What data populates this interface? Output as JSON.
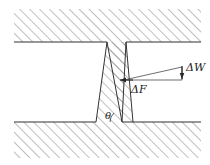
{
  "figure": {
    "type": "mechanics-crack-wedge-diagram",
    "background_color": "#ffffff",
    "line_color": "#333333",
    "hatch_color": "#808080",
    "labels": {
      "force_increment": "ΔF",
      "work_increment": "ΔW",
      "crack_angle": "θ"
    },
    "arrows": [
      {
        "name": "force-increment-arrow",
        "label": "ΔF",
        "direction": "left",
        "description": "horizontal arrow pointing into the crack wall"
      },
      {
        "name": "work-increment-arrow",
        "label": "ΔW",
        "direction": "down",
        "description": "short vertical arrow at the right tip of the wedge"
      }
    ],
    "regions": [
      {
        "name": "upper-block",
        "hatched": true
      },
      {
        "name": "lower-block",
        "hatched": true
      },
      {
        "name": "crack-wedge",
        "hatched": true
      }
    ]
  }
}
